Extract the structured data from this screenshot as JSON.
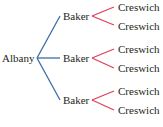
{
  "tree": {
    "root": "Albany",
    "level1": [
      "Baker",
      "Baker",
      "Baker"
    ],
    "level2": [
      "Creswich",
      "Creswich",
      "Creswich",
      "Creswich",
      "Creswich",
      "Creswich"
    ],
    "colors": {
      "level1_edges": "#3a6ea5",
      "level2_edges": "#e0405a",
      "text": "#231f20"
    }
  }
}
